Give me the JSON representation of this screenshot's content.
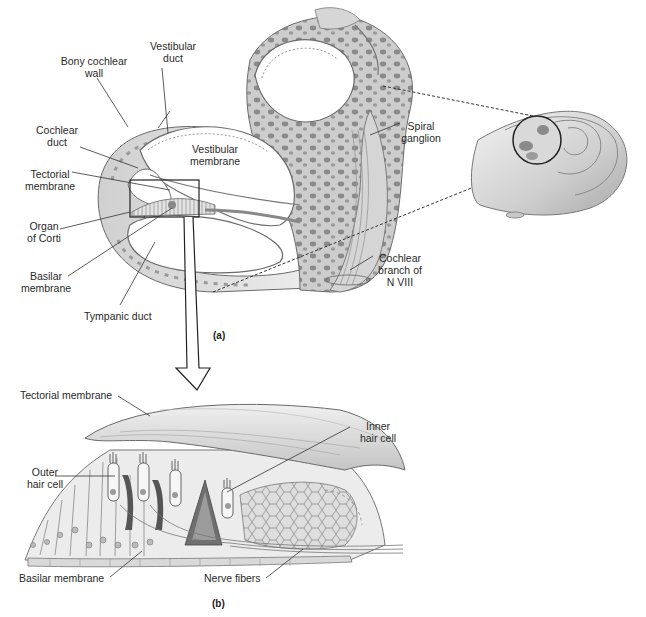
{
  "figure": {
    "title_partial": "",
    "panel_a": {
      "tag": "(a)",
      "labels": {
        "bony_cochlear_wall": [
          "Bony cochlear",
          "wall"
        ],
        "vestibular_duct": [
          "Vestibular",
          "duct"
        ],
        "cochlear_duct": [
          "Cochlear",
          "duct"
        ],
        "vestibular_membrane": [
          "Vestibular",
          "membrane"
        ],
        "tectorial_membrane": [
          "Tectorial",
          "membrane"
        ],
        "organ_of_corti": [
          "Organ",
          "of Corti"
        ],
        "basilar_membrane": [
          "Basilar",
          "membrane"
        ],
        "tympanic_duct": "Tympanic duct",
        "spiral_ganglion": [
          "Spiral",
          "ganglion"
        ],
        "cochlear_branch": [
          "Cochlear",
          "branch of",
          "N VIII"
        ]
      }
    },
    "panel_b": {
      "tag": "(b)",
      "labels": {
        "tectorial_membrane": "Tectorial membrane",
        "outer_hair_cell": [
          "Outer",
          "hair cell"
        ],
        "inner_hair_cell": [
          "Inner",
          "hair cell"
        ],
        "basilar_membrane": "Basilar membrane",
        "nerve_fibers": "Nerve fibers"
      }
    },
    "colors": {
      "tissue_light": "#e6e6e6",
      "tissue_mid": "#c9c9c9",
      "tissue_dark": "#8f8f8f",
      "outline": "#555555",
      "leader_line": "#333333",
      "background": "#ffffff"
    }
  }
}
